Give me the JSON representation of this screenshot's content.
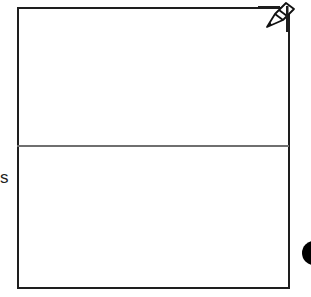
{
  "canvas": {
    "frame_color": "#1e1e1e",
    "divider_color": "#6f6f6f",
    "sections": [
      "top-panel",
      "bottom-panel"
    ]
  },
  "side_label": {
    "text": "s"
  },
  "icons": {
    "pencil": "pencil-icon",
    "dot": "filled-circle-icon"
  }
}
